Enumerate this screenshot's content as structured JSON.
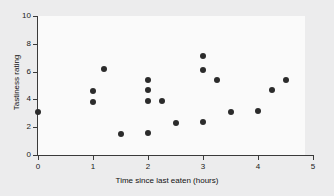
{
  "chart_data": {
    "type": "scatter",
    "title": "",
    "xlabel": "Time since last eaten (hours)",
    "ylabel": "Tastiness rating",
    "xlim": [
      0,
      5
    ],
    "ylim": [
      0,
      10
    ],
    "xticks": [
      0,
      1,
      2,
      3,
      4,
      5
    ],
    "yticks": [
      0,
      2,
      4,
      6,
      8,
      10
    ],
    "xtick_labels": [
      "0",
      "1",
      "2",
      "3",
      "4",
      "5"
    ],
    "ytick_labels": [
      "0",
      "2",
      "4",
      "6",
      "8",
      "10"
    ],
    "grid": false,
    "legend": null,
    "marker_color": "#2b2b2b",
    "plot_background": "#fafafa",
    "figure_background": "#ececed",
    "points": [
      {
        "x": 0.0,
        "y": 3.1
      },
      {
        "x": 1.0,
        "y": 4.6
      },
      {
        "x": 1.0,
        "y": 3.8
      },
      {
        "x": 1.2,
        "y": 6.2
      },
      {
        "x": 1.5,
        "y": 1.5
      },
      {
        "x": 2.0,
        "y": 5.4
      },
      {
        "x": 2.0,
        "y": 4.65
      },
      {
        "x": 2.0,
        "y": 3.85
      },
      {
        "x": 2.0,
        "y": 1.55
      },
      {
        "x": 2.25,
        "y": 3.85
      },
      {
        "x": 2.5,
        "y": 2.3
      },
      {
        "x": 3.0,
        "y": 7.1
      },
      {
        "x": 3.0,
        "y": 6.15
      },
      {
        "x": 3.0,
        "y": 2.35
      },
      {
        "x": 3.25,
        "y": 5.4
      },
      {
        "x": 3.5,
        "y": 3.1
      },
      {
        "x": 4.0,
        "y": 3.15
      },
      {
        "x": 4.25,
        "y": 4.65
      },
      {
        "x": 4.5,
        "y": 5.4
      }
    ]
  }
}
